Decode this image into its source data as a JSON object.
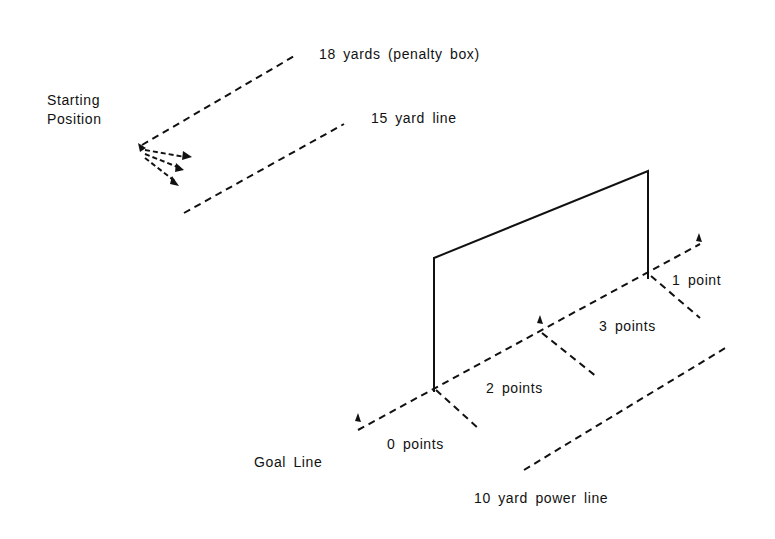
{
  "diagram": {
    "labels": {
      "starting_position_line1": "Starting",
      "starting_position_line2": "Position",
      "penalty_box": "18 yards (penalty box)",
      "fifteen_yard": "15 yard line",
      "one_point": "1 point",
      "three_points": "3 points",
      "two_points": "2 points",
      "zero_points": "0 points",
      "goal_line": "Goal Line",
      "power_line": "10 yard power line"
    },
    "colors": {
      "ink": "#111111",
      "background": "#ffffff"
    }
  }
}
